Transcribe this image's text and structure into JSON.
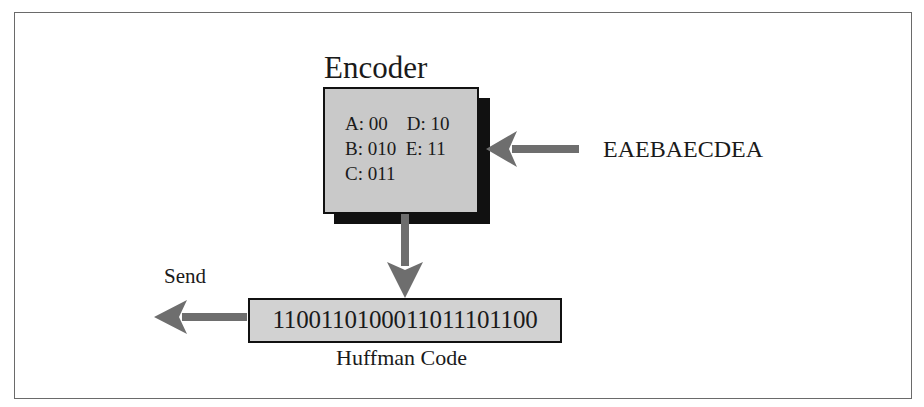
{
  "diagram": {
    "encoder": {
      "title": "Encoder",
      "codes": [
        {
          "row": "A: 00    D: 10"
        },
        {
          "row": "B: 010  E: 11"
        },
        {
          "row": "C: 011"
        }
      ],
      "code_table": [
        {
          "symbol": "A",
          "code": "00"
        },
        {
          "symbol": "B",
          "code": "010"
        },
        {
          "symbol": "C",
          "code": "011"
        },
        {
          "symbol": "D",
          "code": "10"
        },
        {
          "symbol": "E",
          "code": "11"
        }
      ]
    },
    "input": {
      "text": "EAEBAECDEA"
    },
    "output": {
      "code": "1100110100011011101100",
      "caption": "Huffman Code",
      "send_label": "Send"
    },
    "colors": {
      "box_fill": "#c9c9c9",
      "code_box_fill": "#d2d2d2",
      "arrow": "#6e6e6e",
      "shadow": "#111111",
      "frame": "#6a6a6a"
    }
  }
}
